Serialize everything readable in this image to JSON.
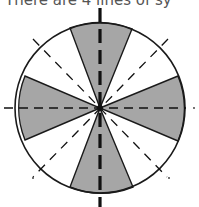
{
  "caption": {
    "text": "There are 4 lines of sy"
  },
  "figure": {
    "lines_of_symmetry": 4,
    "colors": {
      "shaded": "#a6a6a6",
      "unshaded": "#ffffff",
      "stroke": "#1a1a1a"
    }
  }
}
